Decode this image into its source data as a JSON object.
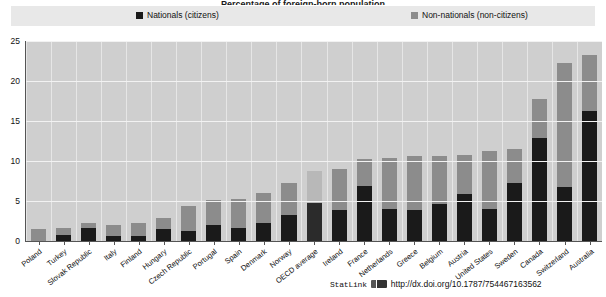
{
  "title_partial": "Percentage of foreign-born population",
  "legend": {
    "position": "top",
    "items": [
      {
        "label": "Nationals (citizens)",
        "color": "#1a1a1a",
        "icon": "square-swatch"
      },
      {
        "label": "Non-nationals (non-citizens)",
        "color": "#8c8c8c",
        "icon": "square-swatch"
      }
    ]
  },
  "footer": {
    "statlink_label": "StatLink",
    "statlink_icon": "statlink-barcode-icon",
    "url": "http://dx.doi.org/10.1787/754467163562"
  },
  "chart_data": {
    "type": "bar",
    "stacked": true,
    "title": "",
    "xlabel": "",
    "ylabel": "",
    "ylim": [
      0,
      25
    ],
    "yticks": [
      0,
      5,
      10,
      15,
      20,
      25
    ],
    "grid": true,
    "legend_position": "top",
    "highlight_category": "OECD average",
    "categories": [
      "Poland",
      "Turkey",
      "Slovak Republic",
      "Italy",
      "Finland",
      "Hungary",
      "Czech Republic",
      "Portugal",
      "Spain",
      "Denmark",
      "Norway",
      "OECD average",
      "Ireland",
      "France",
      "Netherlands",
      "Greece",
      "Belgium",
      "Austria",
      "United States",
      "Sweden",
      "Canada",
      "Switzerland",
      "Australia"
    ],
    "series": [
      {
        "name": "Nationals (citizens)",
        "color": "#1a1a1a",
        "values": [
          0.0,
          0.7,
          1.6,
          0.6,
          0.6,
          1.5,
          1.3,
          2.0,
          1.6,
          2.2,
          3.2,
          4.7,
          3.9,
          6.9,
          4.0,
          3.9,
          4.6,
          5.9,
          4.0,
          7.3,
          12.9,
          6.8,
          16.2
        ]
      },
      {
        "name": "Non-nationals (non-citizens)",
        "color": "#8c8c8c",
        "values": [
          1.5,
          0.9,
          0.6,
          1.4,
          1.6,
          1.4,
          3.1,
          3.1,
          3.7,
          3.8,
          4.0,
          4.1,
          5.1,
          3.3,
          6.4,
          6.7,
          6.0,
          4.9,
          7.2,
          4.2,
          4.9,
          15.4,
          7.1
        ]
      }
    ],
    "totals": [
      1.5,
      1.6,
      2.2,
      2.0,
      2.2,
      2.9,
      4.4,
      5.1,
      5.3,
      6.0,
      7.2,
      8.8,
      9.0,
      10.2,
      10.4,
      10.6,
      10.6,
      10.8,
      11.2,
      11.5,
      17.8,
      22.2,
      23.3
    ]
  }
}
